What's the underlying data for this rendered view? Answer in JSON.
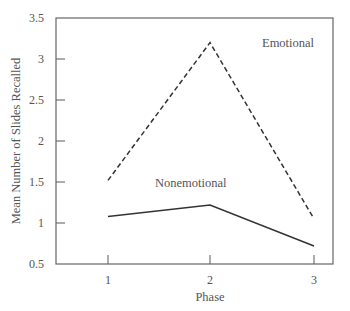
{
  "chart_data": {
    "type": "line",
    "title": "",
    "xlabel": "Phase",
    "ylabel": "Mean Number of Slides Recalled",
    "x": [
      1,
      2,
      3
    ],
    "categories": [
      "1",
      "2",
      "3"
    ],
    "ylim": [
      0.5,
      3.5
    ],
    "yticks": [
      "0.5",
      "1",
      "1.5",
      "2",
      "2.5",
      "3",
      "3.5"
    ],
    "grid": false,
    "legend_position": "inline labels",
    "series": [
      {
        "name": "Emotional",
        "style": "dashed",
        "values": [
          1.52,
          3.2,
          1.05
        ]
      },
      {
        "name": "Nonemotional",
        "style": "solid",
        "values": [
          1.08,
          1.22,
          0.72
        ]
      }
    ]
  }
}
